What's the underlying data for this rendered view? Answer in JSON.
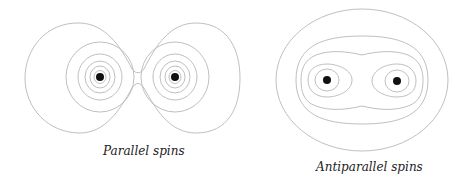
{
  "panels": [
    {
      "id": "parallel",
      "caption": "Parallel spins",
      "nuclei": [
        {
          "x": 100,
          "y": 77
        },
        {
          "x": 175,
          "y": 77
        }
      ]
    },
    {
      "id": "antiparallel",
      "caption": "Antiparallel spins",
      "nuclei": [
        {
          "x": 327,
          "y": 80
        },
        {
          "x": 397,
          "y": 81
        }
      ]
    }
  ],
  "colors": {
    "contour": "#b8b8b8",
    "nucleus": "#111111",
    "text": "#222222"
  }
}
